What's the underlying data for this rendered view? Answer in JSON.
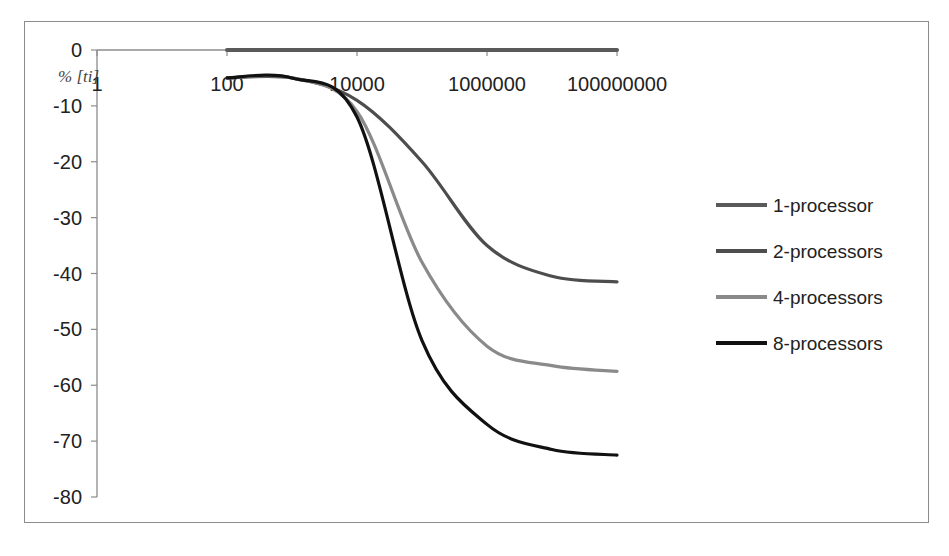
{
  "chart_data": {
    "type": "line",
    "title": "",
    "xlabel": "",
    "ylabel": "% [ti]",
    "xscale": "log",
    "x_ticks": [
      "1",
      "100",
      "10000",
      "1000000",
      "100000000"
    ],
    "y_ticks": [
      "0",
      "-10",
      "-20",
      "-30",
      "-40",
      "-50",
      "-60",
      "-70",
      "-80"
    ],
    "ylim": [
      -80,
      0
    ],
    "xlim": [
      1,
      100000000
    ],
    "grid": false,
    "legend_position": "right",
    "x": [
      100,
      1000,
      10000,
      100000,
      1000000,
      10000000,
      100000000
    ],
    "series": [
      {
        "name": "1-processor",
        "color": "#5a5a5a",
        "values": [
          0,
          0,
          0,
          0,
          0,
          0,
          0
        ]
      },
      {
        "name": "2-processors",
        "color": "#4d4d4d",
        "values": [
          -5,
          -5,
          -9,
          -20,
          -35,
          -40.5,
          -41.5
        ]
      },
      {
        "name": "4-processors",
        "color": "#8a8a8a",
        "values": [
          -5,
          -5,
          -11,
          -38,
          -53,
          -56.5,
          -57.5
        ]
      },
      {
        "name": "8-processors",
        "color": "#111111",
        "values": [
          -5,
          -5,
          -12,
          -52,
          -67,
          -71.5,
          -72.5
        ]
      }
    ]
  },
  "legend": {
    "items": [
      "1-processor",
      "2-processors",
      "4-processors",
      "8-processors"
    ]
  },
  "axis": {
    "ylabel": "% [ti]",
    "x_ticks": [
      "1",
      "100",
      "10000",
      "1000000",
      "100000000"
    ],
    "y_ticks": [
      "0",
      "-10",
      "-20",
      "-30",
      "-40",
      "-50",
      "-60",
      "-70",
      "-80"
    ]
  }
}
